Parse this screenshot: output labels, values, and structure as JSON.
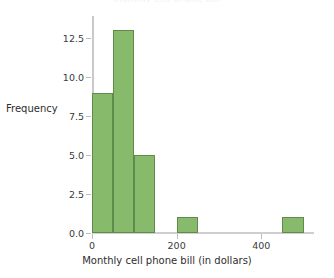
{
  "chart_data": {
    "type": "bar",
    "title": "Monthly cell phone bill",
    "xlabel": "Monthly cell phone bill (in dollars)",
    "ylabel": "Frequency",
    "bin_width": 50,
    "categories": [
      "0-50",
      "50-100",
      "100-150",
      "150-200",
      "200-250",
      "250-300",
      "300-350",
      "350-400",
      "400-450",
      "450-500"
    ],
    "bin_edges": [
      0,
      50,
      100,
      150,
      200,
      250,
      300,
      350,
      400,
      450,
      500
    ],
    "values": [
      9,
      13,
      5,
      0,
      1,
      0,
      0,
      0,
      0,
      1
    ],
    "xlim": [
      0,
      520
    ],
    "ylim": [
      0,
      13.8
    ],
    "xticks": [
      0,
      200,
      400
    ],
    "xtick_labels": [
      "0",
      "200",
      "400"
    ],
    "yticks": [
      0.0,
      2.5,
      5.0,
      7.5,
      10.0,
      12.5
    ],
    "ytick_labels": [
      "0.0",
      "2.5",
      "5.0",
      "7.5",
      "10.0",
      "12.5"
    ],
    "grid": false,
    "legend": null,
    "bar_fill_color": "#88ba6c",
    "bar_edge_color": "#5f8c4c",
    "axis_color": "#c9c9c9",
    "text_color": "#3a3a3a"
  }
}
